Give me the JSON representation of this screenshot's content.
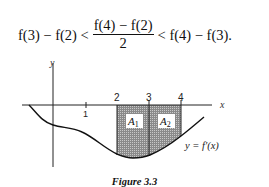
{
  "equation": {
    "left": "f(3) − f(2) <",
    "numerator": "f(4) − f(2)",
    "denominator": "2",
    "right": "< f(4) − f(3)."
  },
  "figure": {
    "y_axis_label": "y",
    "x_axis_label": "x",
    "tick_labels": [
      "1",
      "2",
      "3",
      "4"
    ],
    "region_labels": [
      "A",
      "A"
    ],
    "region_subscripts": [
      "1",
      "2"
    ],
    "curve_label": "y = f′(x)",
    "caption": "Figure 3.3",
    "shade_color": "#9a9a9a",
    "line_color": "#111111"
  }
}
